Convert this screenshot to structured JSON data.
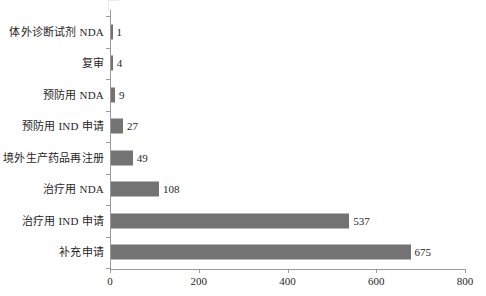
{
  "chart_data": {
    "type": "bar",
    "orientation": "horizontal",
    "title": "",
    "subtitle": "",
    "xlabel": "",
    "ylabel": "",
    "xlim": [
      0,
      800
    ],
    "xticks": [
      0,
      200,
      400,
      600,
      800
    ],
    "xtick_labels": [
      "0",
      "200",
      "400",
      "600",
      "800"
    ],
    "grid": false,
    "legend": null,
    "bar_color": "#737373",
    "axis_color": "#9a9a9a",
    "text_color": "#1f1f1f",
    "categories": [
      "体外诊断试剂 NDA",
      "复审",
      "预防用 NDA",
      "预防用 IND 申请",
      "境外生产药品再注册",
      "治疗用 NDA",
      "治疗用 IND 申请",
      "补充申请"
    ],
    "values": [
      1,
      4,
      9,
      27,
      49,
      108,
      537,
      675
    ],
    "value_labels": [
      "1",
      "4",
      "9",
      "27",
      "49",
      "108",
      "537",
      "675"
    ]
  }
}
